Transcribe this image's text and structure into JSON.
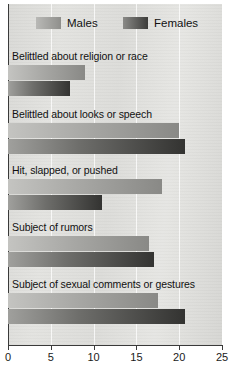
{
  "chart_data": {
    "type": "bar",
    "orientation": "horizontal",
    "title": "",
    "xlabel": "",
    "ylabel": "",
    "xlim": [
      0,
      25
    ],
    "xticks": [
      0,
      5,
      10,
      15,
      20,
      25
    ],
    "grid": true,
    "legend_position": "top",
    "categories": [
      "Belittled about religion or race",
      "Belittled about looks or speech",
      "Hit, slapped, or pushed",
      "Subject of rumors",
      "Subject of sexual comments or gestures"
    ],
    "series": [
      {
        "name": "Males",
        "color": "#a8a8a5",
        "values": [
          9,
          20,
          18,
          16.5,
          17.5
        ]
      },
      {
        "name": "Females",
        "color": "#4a4a48",
        "values": [
          7.3,
          20.7,
          11,
          17,
          20.7
        ]
      }
    ]
  },
  "legend": {
    "items": [
      {
        "label": "Males",
        "swatch": "males-swatch"
      },
      {
        "label": "Females",
        "swatch": "females-swatch"
      }
    ]
  },
  "axis": {
    "tick_labels": [
      "0",
      "5",
      "10",
      "15",
      "20",
      "25"
    ]
  }
}
